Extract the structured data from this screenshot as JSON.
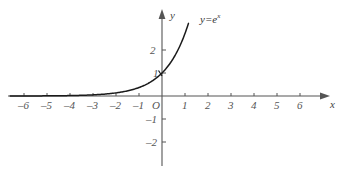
{
  "chart_data": {
    "type": "line",
    "title": "",
    "subtitle": "",
    "xlabel": "x",
    "ylabel": "y",
    "xlim": [
      -6.6,
      6.6
    ],
    "ylim": [
      -2.6,
      3.2
    ],
    "grid": false,
    "legend_position": "inline-curve-label",
    "function": "y=e^x",
    "annotations": [
      {
        "text": "y=e",
        "exponent": "x",
        "x": 1.7,
        "y": 2.9
      }
    ],
    "xticks": [
      -6,
      -5,
      -4,
      -3,
      -2,
      -1,
      1,
      2,
      3,
      4,
      5,
      6
    ],
    "xtick_labels": [
      "–6",
      "–5",
      "–4",
      "–3",
      "–2",
      "–1",
      "1",
      "2",
      "3",
      "4",
      "5",
      "6"
    ],
    "yticks": [
      -2,
      -1,
      1,
      2
    ],
    "ytick_labels": [
      "–2",
      "–1",
      "1",
      "2"
    ],
    "origin_label": "O",
    "series": [
      {
        "name": "y=e^x",
        "color": "#1a1a1a",
        "x": [
          -6.6,
          -6.0,
          -5.5,
          -5.0,
          -4.5,
          -4.0,
          -3.5,
          -3.0,
          -2.5,
          -2.0,
          -1.5,
          -1.0,
          -0.5,
          0.0,
          0.25,
          0.5,
          0.75,
          1.0,
          1.15
        ],
        "y": [
          0.0014,
          0.0025,
          0.0041,
          0.0067,
          0.0111,
          0.0183,
          0.0302,
          0.0498,
          0.0821,
          0.1353,
          0.2231,
          0.3679,
          0.6065,
          1.0,
          1.284,
          1.6487,
          2.117,
          2.7183,
          3.158
        ]
      }
    ]
  },
  "axes": {
    "x_axis_name": "x",
    "y_axis_name": "y",
    "origin": "O",
    "axis_color": "#555555",
    "curve_color": "#1a1a1a",
    "background": "#ffffff"
  },
  "labels": {
    "curve_base": "y=e",
    "curve_exponent": "x"
  }
}
